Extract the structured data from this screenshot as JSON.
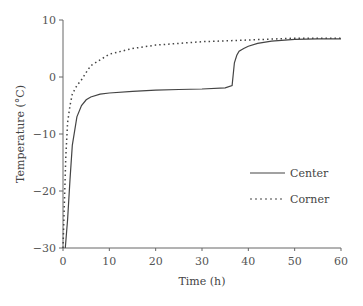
{
  "chart_data": {
    "type": "line",
    "title": "",
    "xlabel": "Time (h)",
    "ylabel": "Temperature (°C)",
    "xlim": [
      0,
      60
    ],
    "ylim": [
      -30,
      10
    ],
    "xticks": [
      0,
      10,
      20,
      30,
      40,
      50,
      60
    ],
    "yticks": [
      -30,
      -20,
      -10,
      0,
      10
    ],
    "grid": false,
    "legend_position": "right-middle",
    "series": [
      {
        "name": "Center",
        "style": "solid",
        "x": [
          0.5,
          1,
          1.5,
          2,
          3,
          4,
          5,
          6,
          8,
          10,
          15,
          20,
          25,
          30,
          35,
          36.5,
          37,
          37.5,
          38,
          39,
          40,
          42,
          45,
          50,
          55,
          60
        ],
        "y": [
          -30,
          -25,
          -18,
          -12,
          -7,
          -5,
          -4,
          -3.5,
          -3,
          -2.8,
          -2.5,
          -2.3,
          -2.2,
          -2.1,
          -1.9,
          -1.5,
          2.5,
          3.8,
          4.5,
          5,
          5.4,
          5.9,
          6.3,
          6.6,
          6.7,
          6.7
        ]
      },
      {
        "name": "Corner",
        "style": "dotted",
        "x": [
          0,
          0.3,
          0.6,
          1,
          1.5,
          2,
          3,
          4,
          5,
          6,
          8,
          10,
          15,
          20,
          25,
          30,
          40,
          50,
          60
        ],
        "y": [
          -30,
          -22,
          -14,
          -8,
          -5,
          -3,
          -1.5,
          -0.5,
          0.8,
          2,
          3,
          4,
          5,
          5.6,
          5.9,
          6.2,
          6.5,
          6.8,
          6.8
        ]
      }
    ]
  },
  "legend": {
    "items": [
      {
        "label": "Center"
      },
      {
        "label": "Corner"
      }
    ]
  },
  "axes": {
    "xlabel": "Time (h)",
    "ylabel": "Temperature (°C)",
    "xtick_labels": [
      "0",
      "10",
      "20",
      "30",
      "40",
      "50",
      "60"
    ],
    "ytick_labels": [
      "10",
      "0",
      "−10",
      "−20",
      "−30"
    ]
  }
}
